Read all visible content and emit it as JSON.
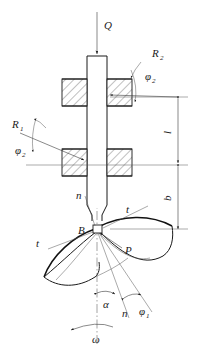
{
  "figure": {
    "type": "engineering-schematic",
    "background_color": "#ffffff",
    "line_color": "#1a1a1a"
  },
  "labels": {
    "axial_load": "Q",
    "radius_upper": "R",
    "radius_upper_sub": "2",
    "radius_lower": "R",
    "radius_lower_sub": "1",
    "angle_phi2_upper": "φ",
    "angle_phi2_upper_sub": "2",
    "angle_phi2_lower": "φ",
    "angle_phi2_lower_sub": "2",
    "angle_phi1": "φ",
    "angle_phi1_sub": "1",
    "angle_alpha": "α",
    "angular_velocity": "ω",
    "force_p": "P",
    "point_b": "B",
    "normal_upper": "n",
    "normal_lower": "n",
    "tangent_upper_right": "t",
    "tangent_left": "t",
    "dimension_l": "l",
    "dimension_b": "b"
  },
  "annotations": [
    {
      "name": "axial-load-arrow",
      "text": "Q",
      "position": "top-center"
    },
    {
      "name": "radius-r2",
      "text": "R2",
      "position": "upper-right"
    },
    {
      "name": "phi2-upper",
      "text": "φ2",
      "position": "upper-right"
    },
    {
      "name": "radius-r1",
      "text": "R1",
      "position": "mid-left"
    },
    {
      "name": "phi2-lower",
      "text": "φ2",
      "position": "mid-left"
    },
    {
      "name": "dimension-l",
      "text": "l",
      "position": "right"
    },
    {
      "name": "dimension-b",
      "text": "b",
      "position": "right"
    },
    {
      "name": "point-b",
      "text": "B",
      "position": "center"
    },
    {
      "name": "force-p",
      "text": "P",
      "position": "lower-right"
    },
    {
      "name": "alpha-angle",
      "text": "α",
      "position": "bottom-center"
    },
    {
      "name": "phi1-angle",
      "text": "φ1",
      "position": "bottom-right"
    },
    {
      "name": "omega-rotation",
      "text": "ω",
      "position": "bottom-center"
    }
  ]
}
